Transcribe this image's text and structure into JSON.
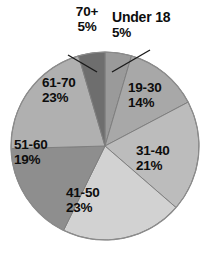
{
  "chart_data": {
    "type": "pie",
    "title": "",
    "subtitle": "",
    "xlabel": "",
    "ylabel": "",
    "legend_position": "none",
    "grid": false,
    "start_angle_deg": 0,
    "direction": "clockwise",
    "categories": [
      "Under 18",
      "19-30",
      "31-40",
      "41-50",
      "51-60",
      "61-70",
      "70+"
    ],
    "values": [
      5,
      14,
      21,
      23,
      19,
      23,
      5
    ],
    "value_unit": "%",
    "slices": [
      {
        "label": "Under 18",
        "value": 5,
        "value_text": "5%",
        "color": "#9a9a9a",
        "label_placement": "outside",
        "leader_line": true
      },
      {
        "label": "19-30",
        "value": 14,
        "value_text": "14%",
        "color": "#a8a8a8",
        "label_placement": "inside",
        "leader_line": false
      },
      {
        "label": "31-40",
        "value": 21,
        "value_text": "21%",
        "color": "#bcbcbc",
        "label_placement": "inside",
        "leader_line": false
      },
      {
        "label": "41-50",
        "value": 23,
        "value_text": "23%",
        "color": "#d2d2d2",
        "label_placement": "inside",
        "leader_line": false
      },
      {
        "label": "51-60",
        "value": 19,
        "value_text": "19%",
        "color": "#8e8e8e",
        "label_placement": "inside",
        "leader_line": false
      },
      {
        "label": "61-70",
        "value": 23,
        "value_text": "23%",
        "color": "#b0b0b0",
        "label_placement": "inside",
        "leader_line": true
      },
      {
        "label": "70+",
        "value": 5,
        "value_text": "5%",
        "color": "#6e6e6e",
        "label_placement": "outside",
        "leader_line": true
      }
    ],
    "colors": {
      "text": "#0d0d0d",
      "outline": "#8c8c8c",
      "background": "#ffffff"
    }
  }
}
